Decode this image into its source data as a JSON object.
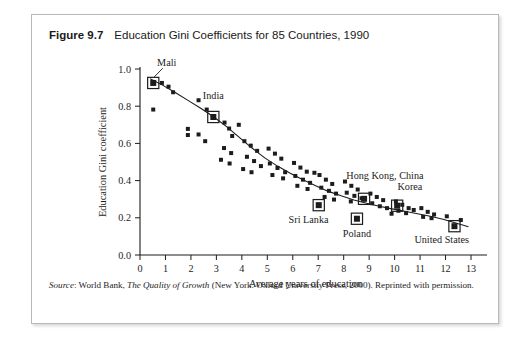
{
  "figure": {
    "number": "Figure 9.7",
    "title": "Education Gini Coefficients for 85 Countries, 1990"
  },
  "source": {
    "label": "Source",
    "separator": ": ",
    "publisher": "World Bank, ",
    "work_title": "The Quality of Growth",
    "citation": " (New York: Oxford University Press, 2000). Reprinted with permission."
  },
  "chart_data": {
    "type": "scatter",
    "title": "Education Gini Coefficients for 85 Countries, 1990",
    "xlabel": "Average years of education",
    "ylabel": "Education Gini coefficient",
    "xlim": [
      0,
      13.6
    ],
    "ylim": [
      0,
      1.0
    ],
    "xticks": [
      0,
      1,
      2,
      3,
      4,
      5,
      6,
      7,
      8,
      9,
      10,
      11,
      12,
      13
    ],
    "yticks": [
      0.0,
      0.2,
      0.4,
      0.6,
      0.8,
      1.0
    ],
    "ytick_labels": [
      "0.0",
      "0.2",
      "0.4",
      "0.6",
      "0.8",
      "1.0"
    ],
    "xtick_labels": [
      "0",
      "1",
      "2",
      "3",
      "4",
      "5",
      "6",
      "7",
      "8",
      "9",
      "10",
      "11",
      "12",
      "13"
    ],
    "grid": false,
    "legend": false,
    "marker_color": "#1c1c1c",
    "trend_color": "#1c1c1c",
    "points": [
      [
        0.52,
        0.925
      ],
      [
        0.86,
        0.925
      ],
      [
        1.12,
        0.905
      ],
      [
        1.3,
        0.875
      ],
      [
        0.52,
        0.782
      ],
      [
        1.88,
        0.678
      ],
      [
        1.88,
        0.645
      ],
      [
        2.3,
        0.832
      ],
      [
        2.62,
        0.782
      ],
      [
        2.88,
        0.742
      ],
      [
        2.3,
        0.648
      ],
      [
        2.56,
        0.612
      ],
      [
        3.32,
        0.712
      ],
      [
        3.5,
        0.68
      ],
      [
        3.62,
        0.64
      ],
      [
        3.88,
        0.7
      ],
      [
        3.3,
        0.575
      ],
      [
        3.58,
        0.548
      ],
      [
        3.18,
        0.512
      ],
      [
        3.52,
        0.492
      ],
      [
        4.1,
        0.612
      ],
      [
        4.35,
        0.588
      ],
      [
        4.6,
        0.56
      ],
      [
        4.2,
        0.528
      ],
      [
        4.48,
        0.505
      ],
      [
        4.75,
        0.478
      ],
      [
        4.05,
        0.462
      ],
      [
        4.38,
        0.445
      ],
      [
        5.05,
        0.572
      ],
      [
        5.3,
        0.545
      ],
      [
        5.55,
        0.518
      ],
      [
        5.1,
        0.492
      ],
      [
        5.4,
        0.468
      ],
      [
        5.7,
        0.445
      ],
      [
        5.2,
        0.43
      ],
      [
        5.62,
        0.412
      ],
      [
        6.05,
        0.495
      ],
      [
        6.3,
        0.47
      ],
      [
        6.55,
        0.448
      ],
      [
        6.1,
        0.425
      ],
      [
        6.4,
        0.405
      ],
      [
        6.68,
        0.388
      ],
      [
        6.18,
        0.372
      ],
      [
        6.58,
        0.355
      ],
      [
        7.02,
        0.268
      ],
      [
        7.05,
        0.43
      ],
      [
        7.3,
        0.405
      ],
      [
        7.55,
        0.382
      ],
      [
        7.12,
        0.362
      ],
      [
        7.42,
        0.345
      ],
      [
        7.7,
        0.33
      ],
      [
        7.25,
        0.312
      ],
      [
        7.62,
        0.298
      ],
      [
        8.05,
        0.395
      ],
      [
        8.3,
        0.372
      ],
      [
        8.55,
        0.352
      ],
      [
        8.12,
        0.335
      ],
      [
        8.42,
        0.318
      ],
      [
        8.7,
        0.305
      ],
      [
        8.28,
        0.288
      ],
      [
        8.52,
        0.195
      ],
      [
        8.8,
        0.302
      ],
      [
        9.05,
        0.33
      ],
      [
        9.3,
        0.312
      ],
      [
        9.55,
        0.295
      ],
      [
        9.12,
        0.278
      ],
      [
        9.42,
        0.262
      ],
      [
        9.7,
        0.252
      ],
      [
        10.05,
        0.288
      ],
      [
        10.3,
        0.27
      ],
      [
        10.1,
        0.265
      ],
      [
        10.55,
        0.252
      ],
      [
        10.15,
        0.238
      ],
      [
        10.45,
        0.225
      ],
      [
        10.75,
        0.242
      ],
      [
        11.05,
        0.252
      ],
      [
        11.3,
        0.232
      ],
      [
        11.55,
        0.218
      ],
      [
        11.12,
        0.205
      ],
      [
        11.45,
        0.198
      ],
      [
        12.05,
        0.208
      ],
      [
        12.35,
        0.155
      ],
      [
        12.6,
        0.188
      ],
      [
        9.88,
        0.222
      ],
      [
        6.85,
        0.442
      ]
    ],
    "highlighted": [
      {
        "name": "Mali",
        "x": 0.52,
        "y": 0.925,
        "label_x": 1.05,
        "label_y": 1.015,
        "leader": true
      },
      {
        "name": "India",
        "x": 2.88,
        "y": 0.742,
        "label_x": 2.88,
        "label_y": 0.838,
        "leader": false
      },
      {
        "name": "Sri Lanka",
        "x": 7.02,
        "y": 0.268,
        "label_x": 6.62,
        "label_y": 0.172,
        "leader": false
      },
      {
        "name": "Poland",
        "x": 8.52,
        "y": 0.195,
        "label_x": 8.52,
        "label_y": 0.098,
        "leader": false
      },
      {
        "name": "Hong Kong, China",
        "x": 8.8,
        "y": 0.302,
        "label_x": 9.62,
        "label_y": 0.408,
        "leader": false
      },
      {
        "name": "Korea",
        "x": 10.1,
        "y": 0.265,
        "label_x": 10.6,
        "label_y": 0.352,
        "leader": false
      },
      {
        "name": "United States",
        "x": 12.35,
        "y": 0.155,
        "label_x": 11.85,
        "label_y": 0.062,
        "leader": false
      }
    ],
    "trend_line": [
      [
        0.4,
        0.948
      ],
      [
        0.9,
        0.912
      ],
      [
        1.4,
        0.872
      ],
      [
        1.9,
        0.83
      ],
      [
        2.4,
        0.788
      ],
      [
        2.9,
        0.742
      ],
      [
        3.4,
        0.69
      ],
      [
        3.9,
        0.632
      ],
      [
        4.4,
        0.575
      ],
      [
        4.9,
        0.522
      ],
      [
        5.4,
        0.478
      ],
      [
        5.9,
        0.44
      ],
      [
        6.4,
        0.405
      ],
      [
        6.9,
        0.372
      ],
      [
        7.4,
        0.342
      ],
      [
        7.9,
        0.318
      ],
      [
        8.4,
        0.296
      ],
      [
        8.9,
        0.278
      ],
      [
        9.4,
        0.262
      ],
      [
        9.9,
        0.248
      ],
      [
        10.4,
        0.235
      ],
      [
        10.9,
        0.222
      ],
      [
        11.4,
        0.208
      ],
      [
        11.9,
        0.192
      ],
      [
        12.4,
        0.172
      ],
      [
        12.9,
        0.152
      ]
    ]
  }
}
